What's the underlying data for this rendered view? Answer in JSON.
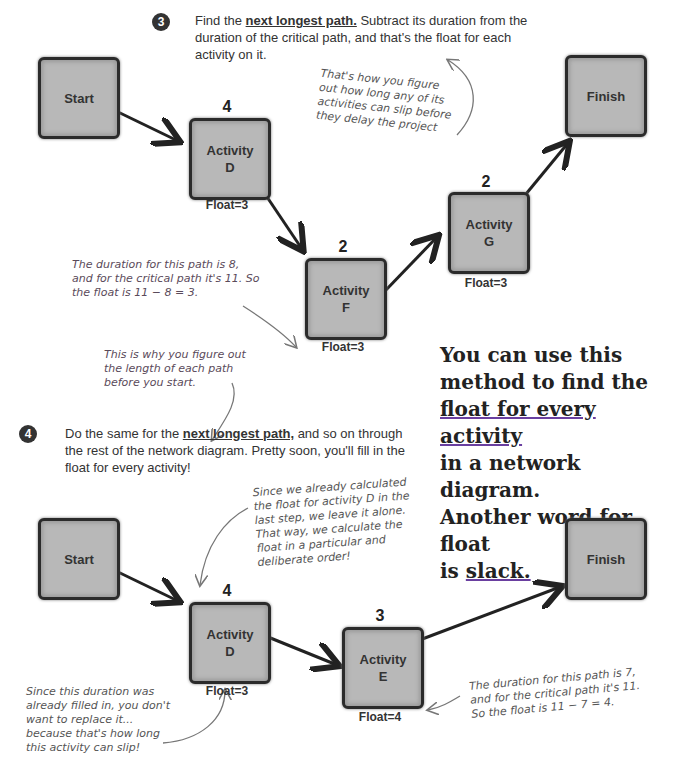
{
  "step3": {
    "number": "3",
    "text_before": "Find the ",
    "emphasis": "next longest path.",
    "text_after": " Subtract its duration from the duration of the critical path, and that's the float for each activity on it."
  },
  "step4": {
    "number": "4",
    "text_before": "Do the same for the ",
    "emphasis": "next longest path,",
    "text_after": " and so on through the rest of the network diagram. Pretty soon, you'll fill in the float for every activity!"
  },
  "diagram_top": {
    "nodes": {
      "start": {
        "label": "Start"
      },
      "finish": {
        "label": "Finish"
      },
      "d": {
        "label1": "Activity",
        "label2": "D",
        "duration": "4",
        "float": "Float=3"
      },
      "f": {
        "label1": "Activity",
        "label2": "F",
        "duration": "2",
        "float": "Float=3"
      },
      "g": {
        "label1": "Activity",
        "label2": "G",
        "duration": "2",
        "float": "Float=3"
      }
    },
    "annotations": {
      "slip": "That's how you figure out how long any of its activities can slip before they delay the project",
      "duration": "The duration for this path is 8, and for the critical path it's 11. So the float is 11 − 8 = 3.",
      "why": "This is why you figure out the length of each path before you start."
    }
  },
  "diagram_bottom": {
    "nodes": {
      "start": {
        "label": "Start"
      },
      "finish": {
        "label": "Finish"
      },
      "d": {
        "label1": "Activity",
        "label2": "D",
        "duration": "4",
        "float": "Float=3"
      },
      "e": {
        "label1": "Activity",
        "label2": "E",
        "duration": "3",
        "float": "Float=4"
      }
    },
    "annotations": {
      "already": "Since we already calculated the float for activity D in the last step, we leave it alone. That way, we calculate the float in a particular and deliberate order!",
      "filled": "Since this duration was already filled in, you don't want to replace it... because that's how long this activity can slip!",
      "duration": "The duration for this path is 7, and for the critical path it's 11. So the float is 11 − 7 = 4."
    }
  },
  "callout": {
    "line1": "You can use this",
    "line2": "method to find the",
    "line3": "float for every activity",
    "line4": "in a network diagram.",
    "line5": "Another word for float",
    "line6_prefix": "is ",
    "line6_underlined": "slack."
  }
}
